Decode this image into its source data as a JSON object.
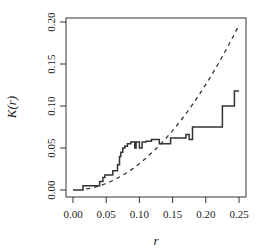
{
  "chart_data": {
    "type": "line",
    "title": "",
    "xlabel": "r",
    "ylabel": "K(r)",
    "xlim": [
      0,
      0.25
    ],
    "ylim": [
      0,
      0.2
    ],
    "x_ticks": [
      "0.00",
      "0.05",
      "0.10",
      "0.15",
      "0.20",
      "0.25"
    ],
    "y_ticks": [
      "0.00",
      "0.05",
      "0.10",
      "0.15",
      "0.20"
    ],
    "grid": false,
    "series": [
      {
        "name": "empirical K(r)",
        "style": "step-solid",
        "x": [
          0.0,
          0.015,
          0.015,
          0.04,
          0.04,
          0.045,
          0.045,
          0.048,
          0.048,
          0.06,
          0.06,
          0.067,
          0.067,
          0.07,
          0.07,
          0.072,
          0.072,
          0.075,
          0.075,
          0.078,
          0.078,
          0.082,
          0.082,
          0.087,
          0.087,
          0.093,
          0.093,
          0.095,
          0.095,
          0.1,
          0.1,
          0.104,
          0.104,
          0.11,
          0.11,
          0.118,
          0.118,
          0.13,
          0.13,
          0.147,
          0.147,
          0.17,
          0.17,
          0.175,
          0.175,
          0.18,
          0.18,
          0.225,
          0.225,
          0.243,
          0.243,
          0.25
        ],
        "y": [
          0.0,
          0.0,
          0.005,
          0.005,
          0.01,
          0.01,
          0.015,
          0.015,
          0.018,
          0.018,
          0.023,
          0.023,
          0.03,
          0.03,
          0.04,
          0.04,
          0.045,
          0.045,
          0.05,
          0.05,
          0.052,
          0.052,
          0.055,
          0.055,
          0.057,
          0.057,
          0.05,
          0.05,
          0.057,
          0.057,
          0.05,
          0.05,
          0.057,
          0.057,
          0.058,
          0.058,
          0.06,
          0.06,
          0.055,
          0.055,
          0.062,
          0.062,
          0.066,
          0.066,
          0.06,
          0.06,
          0.075,
          0.075,
          0.1,
          0.1,
          0.118,
          0.118
        ]
      },
      {
        "name": "theoretical pi r^2",
        "style": "dashed",
        "formula": "pi*r^2"
      }
    ]
  }
}
